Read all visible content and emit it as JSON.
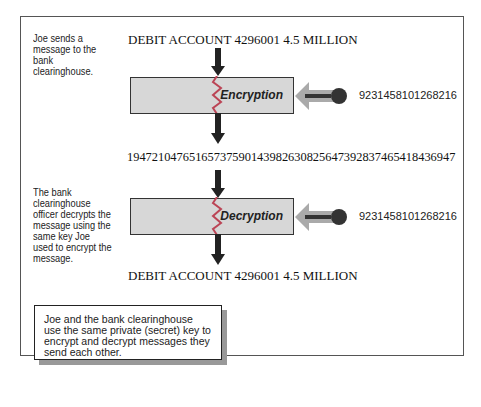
{
  "steps": {
    "encrypt_caption": "Joe sends a message to the bank clearinghouse.",
    "decrypt_caption": "The bank clearinghouse officer decrypts the message using the same key Joe used to encrypt the message."
  },
  "messages": {
    "plaintext_top": "DEBIT ACCOUNT 4296001 4.5 MILLION",
    "ciphertext": "19472104765165737590143982630825647392837465418436947",
    "plaintext_bottom": "DEBIT ACCOUNT 4296001 4.5 MILLION"
  },
  "process": {
    "encryption_label": "Encryption",
    "decryption_label": "Decryption",
    "key_value_1": "9231458101268216",
    "key_value_2": "9231458101268216"
  },
  "note": "Joe and the bank clearinghouse use the same private (secret) key to encrypt and decrypt messages they send each other."
}
